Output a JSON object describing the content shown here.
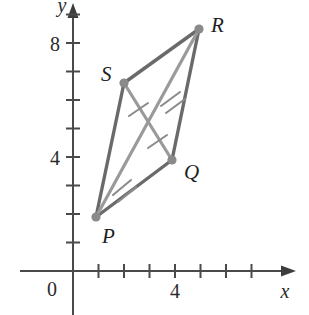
{
  "figure": {
    "axes": {
      "x_label": "x",
      "y_label": "y",
      "origin_label": "0",
      "x_ticks": [
        {
          "value": 1,
          "label": ""
        },
        {
          "value": 2,
          "label": ""
        },
        {
          "value": 3,
          "label": ""
        },
        {
          "value": 4,
          "label": "4"
        },
        {
          "value": 5,
          "label": ""
        },
        {
          "value": 6,
          "label": ""
        },
        {
          "value": 7,
          "label": ""
        },
        {
          "value": 8,
          "label": ""
        }
      ],
      "y_ticks": [
        {
          "value": 1,
          "label": ""
        },
        {
          "value": 2,
          "label": ""
        },
        {
          "value": 3,
          "label": ""
        },
        {
          "value": 4,
          "label": "4"
        },
        {
          "value": 5,
          "label": ""
        },
        {
          "value": 6,
          "label": ""
        },
        {
          "value": 7,
          "label": ""
        },
        {
          "value": 8,
          "label": "8"
        },
        {
          "value": 9,
          "label": ""
        }
      ],
      "x_range": [
        0,
        9
      ],
      "y_range": [
        0,
        9.5
      ]
    },
    "colors": {
      "axis": "#4a4a4a",
      "side": "#6a6a6a",
      "diagonal": "#9a9a9a",
      "vertex_dot": "#8a8a8a",
      "hash": "#8b8b8b",
      "label_text": "#1f1f1f"
    },
    "vertices": [
      {
        "name": "P",
        "x": 0.9,
        "y": 1.9,
        "label": "P",
        "label_dx": 6,
        "label_dy": 26
      },
      {
        "name": "Q",
        "x": 3.9,
        "y": 3.9,
        "label": "Q",
        "label_dx": 12,
        "label_dy": 19
      },
      {
        "name": "R",
        "x": 4.95,
        "y": 8.5,
        "label": "R",
        "label_dx": 12,
        "label_dy": 3
      },
      {
        "name": "S",
        "x": 2.0,
        "y": 6.6,
        "label": "S",
        "label_dx": -23,
        "label_dy": -2
      }
    ],
    "sides": [
      {
        "from": "P",
        "to": "Q"
      },
      {
        "from": "Q",
        "to": "R"
      },
      {
        "from": "R",
        "to": "S"
      },
      {
        "from": "S",
        "to": "P"
      }
    ],
    "diagonals": [
      {
        "from": "P",
        "to": "R",
        "tick_count": 2
      },
      {
        "from": "S",
        "to": "Q",
        "tick_count": 1
      }
    ],
    "congruence_marks": {
      "diagonal_PR": {
        "halves": 2,
        "ticks_per_half": 2
      },
      "diagonal_SQ": {
        "halves": 2,
        "ticks_per_half": 1
      }
    }
  }
}
